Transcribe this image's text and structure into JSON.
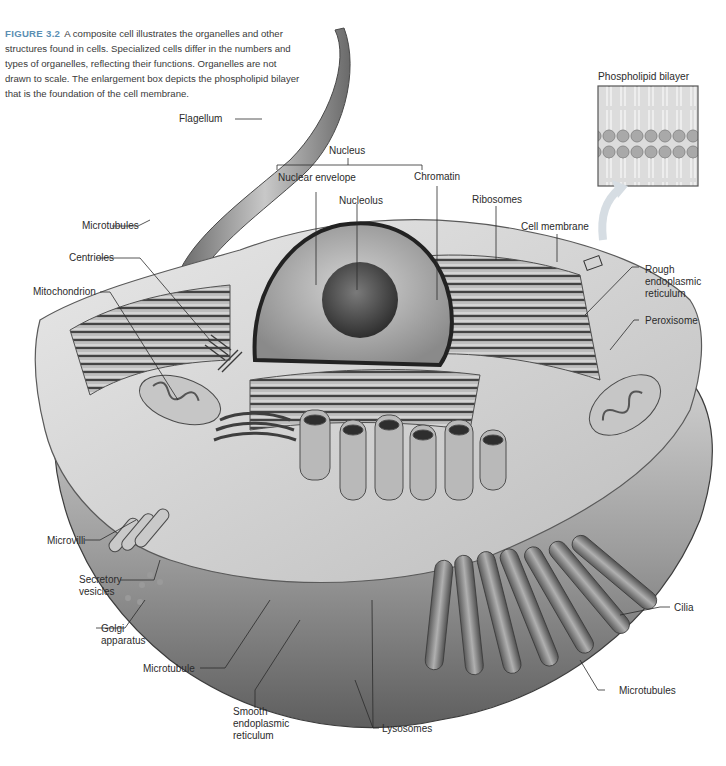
{
  "figure": {
    "number": "FIGURE 3.2",
    "caption": "A composite cell illustrates the organelles and other structures found in cells. Specialized cells differ in the numbers and types of organelles, reflecting their functions. Organelles are not drawn to scale. The enlargement box depicts the phospholipid bilayer that is the foundation of the cell membrane."
  },
  "inset": {
    "title": "Phospholipid bilayer"
  },
  "labels": {
    "flagellum": "Flagellum",
    "nucleus": "Nucleus",
    "nuclear_envelope": "Nuclear envelope",
    "chromatin": "Chromatin",
    "nucleolus": "Nucleolus",
    "ribosomes": "Ribosomes",
    "cell_membrane": "Cell membrane",
    "microtubules_top": "Microtubules",
    "centrioles": "Centrioles",
    "mitochondrion": "Mitochondrion",
    "rough_er": [
      "Rough",
      "endoplasmic",
      "reticulum"
    ],
    "peroxisome": "Peroxisome",
    "microvilli": "Microvilli",
    "secretory_vesicles": [
      "Secretory",
      "vesicles"
    ],
    "golgi": [
      "Golgi",
      "apparatus"
    ],
    "microtubule": "Microtubule",
    "smooth_er": [
      "Smooth",
      "endoplasmic",
      "reticulum"
    ],
    "lysosomes": "Lysosomes",
    "cilia": "Cilia",
    "microtubules_bottom": "Microtubules"
  },
  "colors": {
    "caption_accent": "#5a8fb3",
    "leader_line": "#2b2b2b",
    "cell_dark": "#6e6e6e",
    "cell_mid": "#a8a8a8",
    "cell_light": "#d6d6d6"
  }
}
